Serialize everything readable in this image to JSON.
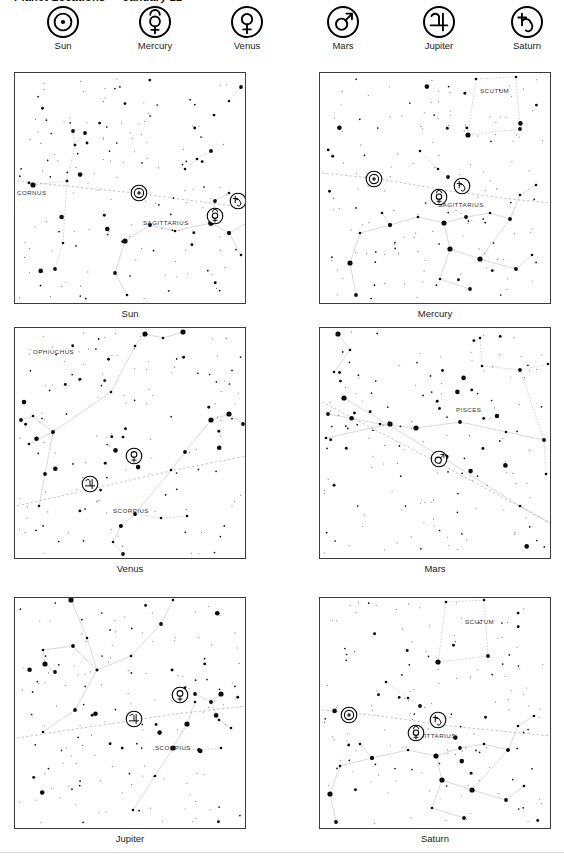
{
  "page": {
    "title": "Planet Locations — January 22",
    "footer_rule": true
  },
  "legend": {
    "items": [
      {
        "name": "Sun",
        "symbol": "☉",
        "icon": "sun-symbol-icon"
      },
      {
        "name": "Mercury",
        "symbol": "☿",
        "icon": "mercury-symbol-icon"
      },
      {
        "name": "Venus",
        "symbol": "♀",
        "icon": "venus-symbol-icon"
      },
      {
        "name": "Mars",
        "symbol": "♂",
        "icon": "mars-symbol-icon"
      },
      {
        "name": "Jupiter",
        "symbol": "♃",
        "icon": "jupiter-symbol-icon"
      },
      {
        "name": "Saturn",
        "symbol": "♄",
        "icon": "saturn-symbol-icon"
      }
    ]
  },
  "charts": [
    {
      "caption": "Sun",
      "constellations": [
        "CAPRICORNUS",
        "SAGITTARIUS"
      ],
      "markers": [
        "Sun",
        "Mercury",
        "Saturn"
      ],
      "labels": [
        {
          "text": "CORNUS",
          "x": 2,
          "y": 122
        },
        {
          "text": "SAGITTARIUS",
          "x": 128,
          "y": 152
        }
      ],
      "planet_markers": [
        {
          "symbol": "☉",
          "name": "Sun",
          "x": 124,
          "y": 120
        },
        {
          "symbol": "☿",
          "name": "Mercury",
          "x": 200,
          "y": 143
        },
        {
          "symbol": "♄",
          "name": "Saturn",
          "x": 223,
          "y": 128
        }
      ]
    },
    {
      "caption": "Mercury",
      "constellations": [
        "SCUTUM",
        "SAGITTARIUS"
      ],
      "markers": [
        "Sun",
        "Mercury",
        "Saturn"
      ],
      "labels": [
        {
          "text": "SCUTUM",
          "x": 160,
          "y": 20
        },
        {
          "text": "SAGITTARIUS",
          "x": 118,
          "y": 134
        }
      ],
      "planet_markers": [
        {
          "symbol": "☉",
          "name": "Sun",
          "x": 54,
          "y": 106
        },
        {
          "symbol": "☿",
          "name": "Mercury",
          "x": 119,
          "y": 124
        },
        {
          "symbol": "♄",
          "name": "Saturn",
          "x": 142,
          "y": 113
        }
      ]
    },
    {
      "caption": "Venus",
      "constellations": [
        "OPHIUCHUS",
        "SCORPIUS"
      ],
      "markers": [
        "Venus",
        "Jupiter"
      ],
      "labels": [
        {
          "text": "OPHIUCHUS",
          "x": 18,
          "y": 26
        },
        {
          "text": "SCORPIUS",
          "x": 98,
          "y": 185
        }
      ],
      "planet_markers": [
        {
          "symbol": "♀",
          "name": "Venus",
          "x": 119,
          "y": 128
        },
        {
          "symbol": "♃",
          "name": "Jupiter",
          "x": 75,
          "y": 156
        }
      ]
    },
    {
      "caption": "Mars",
      "constellations": [
        "PISCES"
      ],
      "markers": [
        "Mars"
      ],
      "labels": [
        {
          "text": "PISCES",
          "x": 136,
          "y": 84
        }
      ],
      "planet_markers": [
        {
          "symbol": "♂",
          "name": "Mars",
          "x": 119,
          "y": 131
        }
      ]
    },
    {
      "caption": "Jupiter",
      "constellations": [
        "SCORPIUS"
      ],
      "markers": [
        "Venus",
        "Jupiter"
      ],
      "labels": [
        {
          "text": "SCORPIUS",
          "x": 140,
          "y": 152
        }
      ],
      "planet_markers": [
        {
          "symbol": "♀",
          "name": "Venus",
          "x": 165,
          "y": 97
        },
        {
          "symbol": "♃",
          "name": "Jupiter",
          "x": 119,
          "y": 121
        }
      ]
    },
    {
      "caption": "Saturn",
      "constellations": [
        "SCUTUM",
        "SAGITTARIUS"
      ],
      "markers": [
        "Sun",
        "Mercury",
        "Saturn"
      ],
      "labels": [
        {
          "text": "SCUTUM",
          "x": 145,
          "y": 26
        },
        {
          "text": "SAGITTARIUS",
          "x": 90,
          "y": 140
        }
      ],
      "planet_markers": [
        {
          "symbol": "☉",
          "name": "Sun",
          "x": 29,
          "y": 117
        },
        {
          "symbol": "☿",
          "name": "Mercury",
          "x": 96,
          "y": 135
        },
        {
          "symbol": "♄",
          "name": "Saturn",
          "x": 118,
          "y": 122
        }
      ]
    }
  ]
}
